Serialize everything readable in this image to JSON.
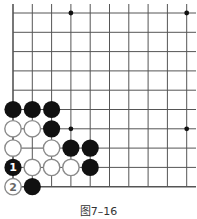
{
  "diagram": {
    "type": "go-board-fragment",
    "caption": "图7–16",
    "colors": {
      "line": "#555555",
      "black_stone": "#111111",
      "white_stone_fill": "#ffffff",
      "white_stone_edge": "#8a8a8a",
      "star": "#111111"
    },
    "grid": {
      "columns": 10,
      "rows": 10,
      "edges": [
        "left",
        "bottom"
      ]
    },
    "star_points": [
      {
        "col": 3,
        "row": 0
      },
      {
        "col": 9,
        "row": 0
      },
      {
        "col": 3,
        "row": 6
      },
      {
        "col": 9,
        "row": 6
      }
    ],
    "stones": [
      {
        "color": "black",
        "col": 0,
        "row": 5
      },
      {
        "color": "black",
        "col": 1,
        "row": 5
      },
      {
        "color": "black",
        "col": 2,
        "row": 5
      },
      {
        "color": "white",
        "col": 0,
        "row": 6
      },
      {
        "color": "white",
        "col": 1,
        "row": 6
      },
      {
        "color": "black",
        "col": 2,
        "row": 6
      },
      {
        "color": "white",
        "col": 0,
        "row": 7
      },
      {
        "color": "white",
        "col": 2,
        "row": 7
      },
      {
        "color": "black",
        "col": 3,
        "row": 7
      },
      {
        "color": "black",
        "col": 4,
        "row": 7
      },
      {
        "color": "black",
        "col": 0,
        "row": 8,
        "label": "1"
      },
      {
        "color": "white",
        "col": 1,
        "row": 8
      },
      {
        "color": "white",
        "col": 2,
        "row": 8
      },
      {
        "color": "white",
        "col": 3,
        "row": 8
      },
      {
        "color": "black",
        "col": 4,
        "row": 8
      },
      {
        "color": "white",
        "col": 0,
        "row": 9,
        "label": "2"
      },
      {
        "color": "black",
        "col": 1,
        "row": 9
      }
    ]
  }
}
